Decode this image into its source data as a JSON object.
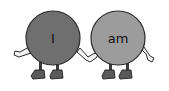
{
  "illustration": {
    "characters": [
      {
        "word": "I",
        "body_color": "#6f6f6f"
      },
      {
        "word": "am",
        "body_color": "#9c9c9c"
      }
    ],
    "outline_color": "#2a2a2a",
    "limb_color": "#f2f2f2",
    "boot_color": "#5a5a5a"
  }
}
